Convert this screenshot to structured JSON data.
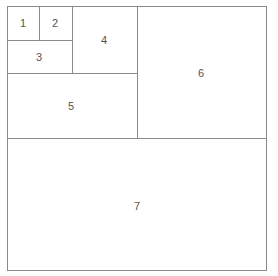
{
  "diagram": {
    "type": "nested-rectangle-subdivision",
    "line_color": "#8a8a8a",
    "label_color": "#555555",
    "background": "#ffffff",
    "boxes": [
      {
        "id": "1",
        "label": "1",
        "x": 7,
        "y": 6,
        "w": 33,
        "h": 35,
        "lx": 23,
        "ly": 23
      },
      {
        "id": "2",
        "label": "2",
        "x": 39,
        "y": 6,
        "w": 34,
        "h": 35,
        "lx": 55,
        "ly": 23
      },
      {
        "id": "3",
        "label": "3",
        "x": 7,
        "y": 40,
        "w": 66,
        "h": 34,
        "lx": 39,
        "ly": 57
      },
      {
        "id": "4",
        "label": "4",
        "x": 72,
        "y": 6,
        "w": 66,
        "h": 68,
        "lx": 104,
        "ly": 40
      },
      {
        "id": "5",
        "label": "5",
        "x": 7,
        "y": 73,
        "w": 131,
        "h": 66,
        "lx": 71,
        "ly": 106
      },
      {
        "id": "6",
        "label": "6",
        "x": 137,
        "y": 6,
        "w": 130,
        "h": 133,
        "lx": 201,
        "ly": 73
      },
      {
        "id": "7",
        "label": "7",
        "x": 7,
        "y": 138,
        "w": 260,
        "h": 133,
        "lx": 137,
        "ly": 206
      }
    ]
  }
}
